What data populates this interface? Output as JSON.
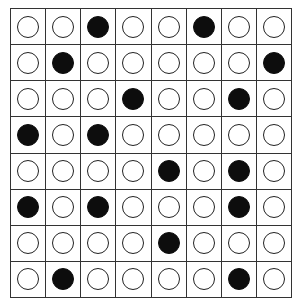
{
  "board": {
    "rows": 8,
    "cols": 8,
    "colors": {
      "filled": "#0d0d0d",
      "empty": "#ffffff",
      "grid": "#333333"
    },
    "cells": [
      [
        0,
        0,
        1,
        0,
        0,
        1,
        0,
        0
      ],
      [
        0,
        1,
        0,
        0,
        0,
        0,
        0,
        1
      ],
      [
        0,
        0,
        0,
        1,
        0,
        0,
        1,
        0
      ],
      [
        1,
        0,
        1,
        0,
        0,
        0,
        0,
        0
      ],
      [
        0,
        0,
        0,
        0,
        1,
        0,
        1,
        0
      ],
      [
        1,
        0,
        1,
        0,
        0,
        0,
        1,
        0
      ],
      [
        0,
        0,
        0,
        0,
        1,
        0,
        0,
        0
      ],
      [
        0,
        1,
        0,
        0,
        0,
        0,
        1,
        0
      ]
    ]
  }
}
